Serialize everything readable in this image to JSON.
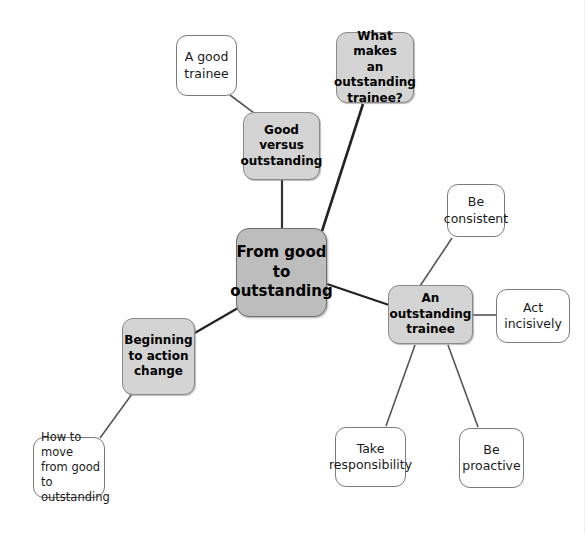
{
  "diagram": {
    "type": "mind-map",
    "title": "From good to outstanding",
    "background_color": "#ffffff",
    "central_fill": "#bdbdbd",
    "secondary_fill": "#d4d4d4",
    "leaf_fill": "#ffffff",
    "stroke_color": "#7b7b7b"
  },
  "nodes": {
    "central": {
      "label": "From good\nto\noutstanding"
    },
    "good_versus_outstanding": {
      "label": "Good\nversus\noutstanding"
    },
    "a_good_trainee": {
      "label": "A good\ntrainee"
    },
    "what_makes_outstanding": {
      "label": "What makes\nan\noutstanding\ntrainee?"
    },
    "an_outstanding_trainee": {
      "label": "An\noutstanding\ntrainee"
    },
    "be_consistent": {
      "label": "Be\nconsistent"
    },
    "act_incisively": {
      "label": "Act incisively"
    },
    "take_responsibility": {
      "label": "Take\nresponsibility"
    },
    "be_proactive": {
      "label": "Be\nproactive"
    },
    "beginning_to_action_change": {
      "label": "Beginning\nto action\nchange"
    },
    "how_to_move": {
      "label": "How to move\nfrom good to\noutstanding"
    }
  },
  "edges": [
    {
      "from": "a_good_trainee",
      "to": "good_versus_outstanding"
    },
    {
      "from": "good_versus_outstanding",
      "to": "central"
    },
    {
      "from": "what_makes_outstanding",
      "to": "central"
    },
    {
      "from": "central",
      "to": "an_outstanding_trainee"
    },
    {
      "from": "central",
      "to": "beginning_to_action_change"
    },
    {
      "from": "an_outstanding_trainee",
      "to": "be_consistent"
    },
    {
      "from": "an_outstanding_trainee",
      "to": "act_incisively"
    },
    {
      "from": "an_outstanding_trainee",
      "to": "take_responsibility"
    },
    {
      "from": "an_outstanding_trainee",
      "to": "be_proactive"
    },
    {
      "from": "beginning_to_action_change",
      "to": "how_to_move"
    }
  ]
}
